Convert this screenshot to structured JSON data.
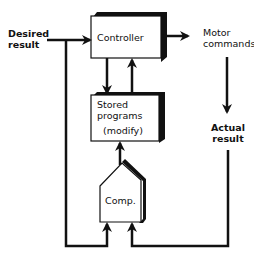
{
  "diagram": {
    "type": "feedback-control-block-diagram",
    "inputs": {
      "desired_result_line1": "Desired",
      "desired_result_line2": "result"
    },
    "blocks": {
      "controller": {
        "label": "Controller"
      },
      "stored_programs": {
        "line1": "Stored",
        "line2": "programs",
        "line3": "(modify)"
      },
      "comparator": {
        "label": "Comp."
      }
    },
    "outputs": {
      "motor_commands_line1": "Motor",
      "motor_commands_line2": "commands",
      "actual_result_line1": "Actual",
      "actual_result_line2": "result"
    },
    "edges": [
      {
        "from": "Desired result",
        "to": "Controller"
      },
      {
        "from": "Controller",
        "to": "Stored programs"
      },
      {
        "from": "Stored programs",
        "to": "Controller"
      },
      {
        "from": "Controller",
        "to": "Motor commands"
      },
      {
        "from": "Motor commands",
        "to": "Actual result"
      },
      {
        "from": "Desired result",
        "to": "Comp."
      },
      {
        "from": "Actual result",
        "to": "Comp."
      },
      {
        "from": "Comp.",
        "to": "Stored programs"
      }
    ],
    "colors": {
      "stroke": "#111111",
      "fill": "#ffffff"
    }
  }
}
